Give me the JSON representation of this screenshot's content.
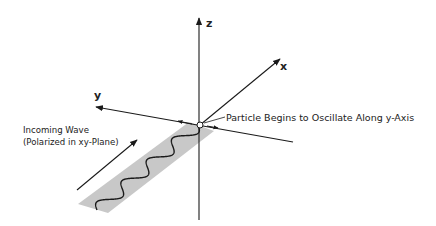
{
  "diagram": {
    "type": "3d-axes-wave-polarization",
    "axes": {
      "x_label": "x",
      "y_label": "y",
      "z_label": "z"
    },
    "annotations": {
      "particle": "Particle Begins to Oscillate Along y-Axis",
      "wave_line1": "Incoming Wave",
      "wave_line2": "(Polarized in xy-Plane)"
    },
    "wave": {
      "oscillations": 4,
      "plane": "xy"
    },
    "colors": {
      "line": "#1a1a1a",
      "band": "#c8c8c8",
      "text": "#222222",
      "background": "#ffffff"
    }
  }
}
